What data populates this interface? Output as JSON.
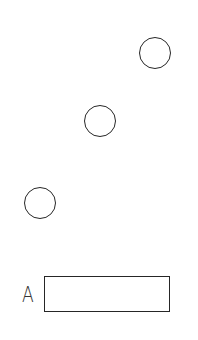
{
  "diagram": {
    "background": "#ffffff",
    "stroke_color": "#262626",
    "circles": [
      {
        "cx": 155,
        "cy": 53,
        "r": 16
      },
      {
        "cx": 100,
        "cy": 121,
        "r": 16
      },
      {
        "cx": 40,
        "cy": 203,
        "r": 16
      }
    ],
    "answer_box": {
      "label": "A",
      "x": 44,
      "y": 276,
      "width": 126,
      "height": 36
    }
  }
}
